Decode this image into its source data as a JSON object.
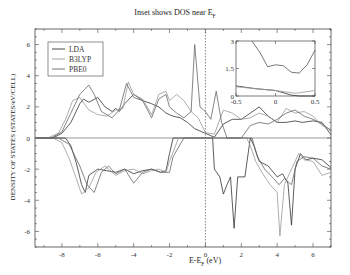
{
  "chart_data": {
    "type": "line",
    "title_main": "Inset shows DOS near E",
    "title_sub": "F",
    "xlabel": "E-E_F (eV)",
    "xlabel_main": "E-E",
    "xlabel_sub": "F",
    "xlabel_unit": " (eV)",
    "ylabel": "DENSITY OF STATES (STATES/eV/CELL)",
    "xlim": [
      -9.5,
      7
    ],
    "ylim": [
      -7,
      7
    ],
    "xticks": [
      "-8",
      "-6",
      "-4",
      "-2",
      "0",
      "2",
      "4",
      "6"
    ],
    "yticks": [
      "-6",
      "-4",
      "-2",
      "0",
      "2",
      "4",
      "6"
    ],
    "grid": false,
    "legend_position": "upper-left",
    "legend": [
      "LDA",
      "B3LYP",
      "PBE0"
    ],
    "fermi_level_line": 0,
    "series": [
      {
        "name": "LDA",
        "color": "#333333",
        "spin_up": [
          [
            -9.5,
            0
          ],
          [
            -8.5,
            0
          ],
          [
            -8,
            0.3
          ],
          [
            -7.5,
            1.0
          ],
          [
            -7,
            2.2
          ],
          [
            -6.8,
            2.5
          ],
          [
            -6.5,
            2.3
          ],
          [
            -6,
            2.6
          ],
          [
            -5.6,
            2.0
          ],
          [
            -5.2,
            1.7
          ],
          [
            -5,
            1.9
          ],
          [
            -4.8,
            1.7
          ],
          [
            -4.5,
            2.2
          ],
          [
            -4,
            2.8
          ],
          [
            -3.5,
            2.4
          ],
          [
            -3,
            2.2
          ],
          [
            -2.6,
            2.0
          ],
          [
            -2.2,
            1.6
          ],
          [
            -1.8,
            1.4
          ],
          [
            -1.4,
            1.3
          ],
          [
            -1.0,
            1.0
          ],
          [
            -0.6,
            0.6
          ],
          [
            -0.2,
            0.4
          ],
          [
            0,
            0.3
          ],
          [
            0.3,
            0.15
          ],
          [
            0.5,
            0.05
          ],
          [
            1,
            0.9
          ],
          [
            1.5,
            1.2
          ],
          [
            2,
            1.2
          ],
          [
            2.5,
            1.6
          ],
          [
            3,
            2.0
          ],
          [
            3.5,
            1.4
          ],
          [
            4,
            1.0
          ],
          [
            4.5,
            1.0
          ],
          [
            5,
            1.1
          ],
          [
            5.4,
            1.0
          ],
          [
            6,
            1.1
          ],
          [
            6.5,
            1.0
          ],
          [
            7,
            0.2
          ]
        ],
        "spin_down": [
          [
            -9.5,
            0
          ],
          [
            -7.8,
            0
          ],
          [
            -7.5,
            -0.5
          ],
          [
            -7.2,
            -1.6
          ],
          [
            -6.9,
            -3.0
          ],
          [
            -6.7,
            -3.5
          ],
          [
            -6.5,
            -2.4
          ],
          [
            -6,
            -2.0
          ],
          [
            -5.5,
            -2.1
          ],
          [
            -5,
            -2.2
          ],
          [
            -4.5,
            -2.0
          ],
          [
            -4,
            -2.3
          ],
          [
            -3.5,
            -2.1
          ],
          [
            -3,
            -2.0
          ],
          [
            -2.5,
            -2.2
          ],
          [
            -2.2,
            -2.1
          ],
          [
            -2,
            -1.0
          ],
          [
            -1.8,
            0
          ],
          [
            -1,
            0
          ],
          [
            0,
            0
          ],
          [
            0.4,
            0
          ],
          [
            0.5,
            -2.0
          ],
          [
            0.8,
            -2.5
          ],
          [
            1.0,
            -3.6
          ],
          [
            1.2,
            -3.0
          ],
          [
            1.4,
            -2.5
          ],
          [
            1.6,
            -5.8
          ],
          [
            1.8,
            -2.5
          ],
          [
            2.2,
            -2.5
          ],
          [
            2.5,
            0
          ],
          [
            2.7,
            -0.5
          ],
          [
            3,
            -1.5
          ],
          [
            3.5,
            -1.8
          ],
          [
            4,
            -2.5
          ],
          [
            4.3,
            -2.3
          ],
          [
            4.6,
            -2.9
          ],
          [
            4.8,
            -5.6
          ],
          [
            5,
            -2.0
          ],
          [
            5.3,
            -1.0
          ],
          [
            5.6,
            -1.4
          ],
          [
            6,
            -1.3
          ],
          [
            6.5,
            -1.4
          ],
          [
            7,
            -1.9
          ]
        ]
      },
      {
        "name": "B3LYP",
        "color": "#999999",
        "spin_up": [
          [
            -9.5,
            0
          ],
          [
            -8.8,
            0
          ],
          [
            -8.2,
            0.3
          ],
          [
            -7.8,
            1.2
          ],
          [
            -7.4,
            2.4
          ],
          [
            -7,
            2.6
          ],
          [
            -6.5,
            1.8
          ],
          [
            -6,
            1.5
          ],
          [
            -5.5,
            1.4
          ],
          [
            -5,
            1.8
          ],
          [
            -4.6,
            1.9
          ],
          [
            -4.3,
            3.6
          ],
          [
            -4,
            2.8
          ],
          [
            -3.5,
            2.5
          ],
          [
            -3,
            1.5
          ],
          [
            -2.6,
            2.8
          ],
          [
            -2.2,
            3.0
          ],
          [
            -2,
            2.4
          ],
          [
            -1.6,
            2.8
          ],
          [
            -1.2,
            2.4
          ],
          [
            -0.8,
            1.7
          ],
          [
            -0.4,
            1.3
          ],
          [
            0,
            0.35
          ],
          [
            0.5,
            0.25
          ],
          [
            1,
            1.8
          ],
          [
            1.5,
            1.6
          ],
          [
            2,
            1.2
          ],
          [
            2.5,
            1.3
          ],
          [
            3,
            1.6
          ],
          [
            3.5,
            1.4
          ],
          [
            4,
            1.0
          ],
          [
            4.5,
            1.9
          ],
          [
            5,
            1.6
          ],
          [
            5.5,
            1.7
          ],
          [
            6,
            1.4
          ],
          [
            6.5,
            0.8
          ],
          [
            7,
            0.5
          ]
        ],
        "spin_down": [
          [
            -9.5,
            0
          ],
          [
            -8.5,
            0
          ],
          [
            -8,
            -0.3
          ],
          [
            -7.6,
            -1.3
          ],
          [
            -7.2,
            -2.6
          ],
          [
            -6.9,
            -3.6
          ],
          [
            -6.5,
            -3.2
          ],
          [
            -6.1,
            -2.2
          ],
          [
            -5.6,
            -1.8
          ],
          [
            -5,
            -2.4
          ],
          [
            -4.5,
            -2.1
          ],
          [
            -4,
            -2.0
          ],
          [
            -3.5,
            -2.3
          ],
          [
            -3,
            -2.1
          ],
          [
            -2.6,
            -2.0
          ],
          [
            -2.2,
            -2.2
          ],
          [
            -2,
            -1.5
          ],
          [
            -1.5,
            0
          ],
          [
            0,
            0
          ],
          [
            2.3,
            0
          ],
          [
            2.5,
            -0.5
          ],
          [
            2.8,
            -1.5
          ],
          [
            3.2,
            -2.3
          ],
          [
            3.6,
            -3.0
          ],
          [
            4.0,
            -3.5
          ],
          [
            4.15,
            -6.3
          ],
          [
            4.4,
            -3.0
          ],
          [
            4.8,
            -2.0
          ],
          [
            5.2,
            -1.0
          ],
          [
            5.5,
            -1.4
          ],
          [
            6,
            -1.5
          ],
          [
            6.5,
            -2.4
          ],
          [
            7,
            -2.2
          ]
        ]
      },
      {
        "name": "PBE0",
        "color": "#666666",
        "spin_up": [
          [
            -9.5,
            0
          ],
          [
            -8.6,
            0
          ],
          [
            -8,
            0.4
          ],
          [
            -7.5,
            1.6
          ],
          [
            -7,
            2.8
          ],
          [
            -6.5,
            3.4
          ],
          [
            -6.2,
            2.8
          ],
          [
            -5.8,
            1.7
          ],
          [
            -5.2,
            1.3
          ],
          [
            -4.8,
            1.8
          ],
          [
            -4.4,
            3.5
          ],
          [
            -4,
            2.6
          ],
          [
            -3.5,
            2.4
          ],
          [
            -3,
            1.3
          ],
          [
            -2.6,
            2.5
          ],
          [
            -2.2,
            2.8
          ],
          [
            -2,
            2.0
          ],
          [
            -1.6,
            1.6
          ],
          [
            -1.2,
            1.3
          ],
          [
            -0.8,
            1.7
          ],
          [
            -0.6,
            6.0
          ],
          [
            -0.3,
            2.0
          ],
          [
            0,
            1.7
          ],
          [
            0.3,
            1.2
          ],
          [
            0.6,
            3.0
          ],
          [
            0.9,
            1.0
          ],
          [
            1.2,
            0
          ],
          [
            2,
            0
          ],
          [
            2.5,
            0.8
          ],
          [
            3,
            1.0
          ],
          [
            3.5,
            0.9
          ],
          [
            4,
            1.2
          ],
          [
            4.5,
            1.6
          ],
          [
            5,
            1.8
          ],
          [
            5.5,
            1.4
          ],
          [
            6,
            1.2
          ],
          [
            6.5,
            0.9
          ],
          [
            7,
            0.5
          ]
        ],
        "spin_down": [
          [
            -9.5,
            0
          ],
          [
            -8.2,
            0
          ],
          [
            -7.6,
            -0.4
          ],
          [
            -7,
            -1.8
          ],
          [
            -6.6,
            -3.0
          ],
          [
            -6.2,
            -3.5
          ],
          [
            -5.8,
            -2.2
          ],
          [
            -5.4,
            -1.8
          ],
          [
            -5,
            -2.3
          ],
          [
            -4.5,
            -2.0
          ],
          [
            -4,
            -2.9
          ],
          [
            -3.5,
            -2.2
          ],
          [
            -3,
            -2.0
          ],
          [
            -2.5,
            -2.2
          ],
          [
            -2,
            -2.2
          ],
          [
            -1.8,
            -1.2
          ],
          [
            -1.2,
            0
          ],
          [
            0,
            0
          ],
          [
            2.4,
            0
          ],
          [
            2.6,
            0
          ],
          [
            2.9,
            -1.2
          ],
          [
            3.3,
            -2.0
          ],
          [
            3.8,
            -2.6
          ],
          [
            4.1,
            -3.0
          ],
          [
            4.4,
            -2.6
          ],
          [
            4.8,
            -3.0
          ],
          [
            5.1,
            -1.5
          ],
          [
            5.5,
            -1.2
          ],
          [
            6,
            -1.3
          ],
          [
            6.5,
            -1.8
          ],
          [
            7,
            -2.0
          ]
        ]
      }
    ],
    "inset": {
      "xlim": [
        -0.5,
        0.5
      ],
      "ylim": [
        0,
        3
      ],
      "xticks": [
        "-0.5",
        "0",
        "0.5"
      ],
      "yticks": [
        "0",
        "1.5",
        "3"
      ],
      "series": [
        {
          "name": "PBE0",
          "color": "#555555",
          "values": [
            [
              -0.3,
              3.0
            ],
            [
              -0.2,
              2.4
            ],
            [
              -0.1,
              1.6
            ],
            [
              0,
              1.7
            ],
            [
              0.1,
              1.65
            ],
            [
              0.2,
              1.3
            ],
            [
              0.3,
              1.25
            ],
            [
              0.4,
              1.7
            ],
            [
              0.5,
              2.5
            ]
          ]
        },
        {
          "name": "LDA",
          "color": "#333333",
          "values": [
            [
              -0.5,
              0.55
            ],
            [
              -0.25,
              0.4
            ],
            [
              0,
              0.3
            ],
            [
              0.2,
              0.05
            ],
            [
              0.3,
              0.0
            ],
            [
              0.5,
              0.0
            ]
          ]
        },
        {
          "name": "B3LYP",
          "color": "#999999",
          "values": [
            [
              -0.5,
              0.5
            ],
            [
              -0.25,
              0.4
            ],
            [
              0,
              0.3
            ],
            [
              0.25,
              0.15
            ],
            [
              0.5,
              0.3
            ]
          ]
        }
      ]
    }
  }
}
